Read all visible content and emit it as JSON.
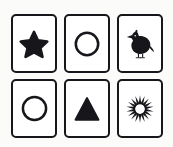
{
  "scene": {
    "title": "Six picture cards grid",
    "background_color": "#fbfbfa",
    "ink_color": "#17161a",
    "card_fill_color": "#ffffff",
    "rows": 2,
    "columns": 3
  },
  "cards": [
    {
      "position": "row-1-col-1",
      "symbol_name": "star",
      "symbol_label": "Star",
      "fill_style": "solid",
      "color": "#17161a",
      "points": 5
    },
    {
      "position": "row-1-col-2",
      "symbol_name": "circle",
      "symbol_label": "Circle",
      "fill_style": "outline",
      "color": "#17161a",
      "stroke_width": 2.4
    },
    {
      "position": "row-1-col-3",
      "symbol_name": "bird",
      "symbol_label": "Bird",
      "fill_style": "solid",
      "color": "#17161a",
      "facing": "left"
    },
    {
      "position": "row-2-col-1",
      "symbol_name": "circle",
      "symbol_label": "Circle",
      "fill_style": "outline",
      "color": "#17161a",
      "stroke_width": 2.4
    },
    {
      "position": "row-2-col-2",
      "symbol_name": "triangle",
      "symbol_label": "Triangle",
      "fill_style": "solid",
      "color": "#17161a",
      "orientation": "point-up"
    },
    {
      "position": "row-2-col-3",
      "symbol_name": "starburst",
      "symbol_label": "Starburst",
      "fill_style": "solid",
      "color": "#17161a",
      "spikes": 18
    }
  ]
}
